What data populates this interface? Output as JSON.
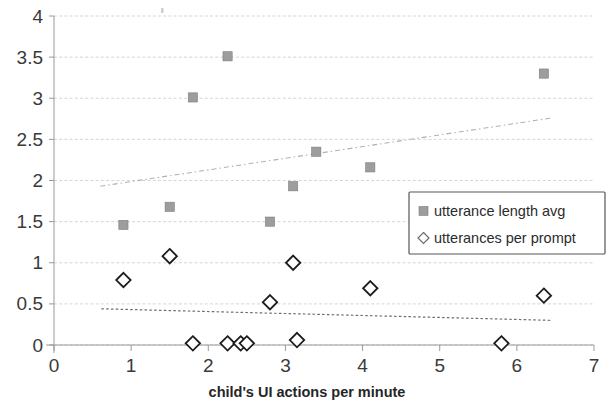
{
  "chart_data": {
    "type": "scatter",
    "title": "",
    "xlabel": "child's UI actions per minute",
    "ylabel": "",
    "xlim": [
      0,
      7
    ],
    "ylim": [
      0,
      4
    ],
    "grid": true,
    "legend_position": "center-right",
    "x_ticks": [
      "0",
      "1",
      "2",
      "3",
      "4",
      "5",
      "6",
      "7"
    ],
    "y_ticks": [
      "0",
      "0.5",
      "1",
      "1.5",
      "2",
      "2.5",
      "3",
      "3.5",
      "4"
    ],
    "series": [
      {
        "name": "utterance length avg",
        "marker": "filled-square",
        "color": "#9d9d9d",
        "points": [
          {
            "x": 0.9,
            "y": 1.46
          },
          {
            "x": 1.5,
            "y": 1.68
          },
          {
            "x": 1.8,
            "y": 3.01
          },
          {
            "x": 2.25,
            "y": 3.51
          },
          {
            "x": 2.8,
            "y": 1.5
          },
          {
            "x": 3.1,
            "y": 1.93
          },
          {
            "x": 3.4,
            "y": 2.35
          },
          {
            "x": 4.1,
            "y": 2.16
          },
          {
            "x": 6.35,
            "y": 3.3
          }
        ]
      },
      {
        "name": "utterances per prompt",
        "marker": "open-diamond",
        "color": "#1c1c1c",
        "points": [
          {
            "x": 0.9,
            "y": 0.79
          },
          {
            "x": 1.5,
            "y": 1.08
          },
          {
            "x": 1.8,
            "y": 0.02
          },
          {
            "x": 2.25,
            "y": 0.02
          },
          {
            "x": 2.42,
            "y": 0.02
          },
          {
            "x": 2.5,
            "y": 0.02
          },
          {
            "x": 2.8,
            "y": 0.52
          },
          {
            "x": 3.1,
            "y": 1.0
          },
          {
            "x": 3.15,
            "y": 0.06
          },
          {
            "x": 4.1,
            "y": 0.69
          },
          {
            "x": 5.8,
            "y": 0.02
          },
          {
            "x": 6.35,
            "y": 0.6
          }
        ]
      }
    ],
    "trendlines": [
      {
        "for_series": "utterance length avg",
        "style": "dash-dot",
        "color": "#b0b0b0",
        "x0": 0.6,
        "y0": 1.93,
        "x1": 6.45,
        "y1": 2.76
      },
      {
        "for_series": "utterances per prompt",
        "style": "dotted",
        "color": "#6d6d6d",
        "x0": 0.62,
        "y0": 0.44,
        "x1": 6.45,
        "y1": 0.3
      }
    ],
    "legend": [
      {
        "label": "utterance length avg",
        "marker": "filled-square"
      },
      {
        "label": "utterances per prompt",
        "marker": "open-diamond"
      }
    ]
  }
}
